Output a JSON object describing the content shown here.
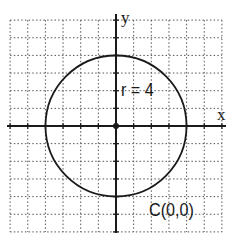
{
  "diagram": {
    "type": "circle-on-coordinate-grid",
    "axes": {
      "x_label": "x",
      "y_label": "y"
    },
    "circle": {
      "center": [
        0,
        0
      ],
      "radius": 4
    },
    "annotations": {
      "radius_text": "r = 4",
      "center_text": "C(0,0)"
    },
    "grid": {
      "x_range": [
        -6,
        6
      ],
      "y_range": [
        -6,
        6
      ],
      "step": 1,
      "style": "dotted"
    },
    "colors": {
      "line": "#1a1a1a",
      "grid": "#555555",
      "background": "#ffffff"
    }
  }
}
